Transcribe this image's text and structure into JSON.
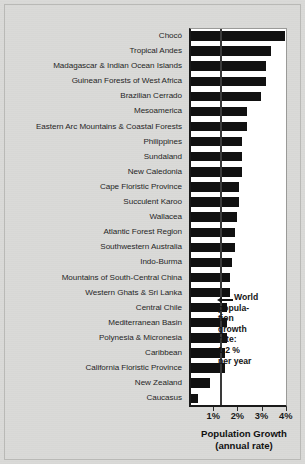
{
  "chart_data": {
    "type": "bar",
    "orientation": "horizontal",
    "title": "",
    "xlabel": "Population Growth",
    "xlabel_sub": "(annual rate)",
    "ylabel": "",
    "xlim": [
      0,
      4.05
    ],
    "grid": false,
    "tick_values": [
      1,
      2,
      3,
      4
    ],
    "tick_labels": [
      "1%",
      "2%",
      "3%",
      "4%"
    ],
    "reference_line": {
      "value": 1.2,
      "label_lines": [
        "World",
        "popula-",
        "tion",
        "growth",
        "rate:",
        "1.2 %",
        "per year"
      ],
      "arrow": "left-arrow-icon"
    },
    "categories": [
      "Chocó",
      "Tropical Andes",
      "Madagascar & Indian Ocean Islands",
      "Guinean Forests of West Africa",
      "Brazilian Cerrado",
      "Mesoamerica",
      "Eastern Arc Mountains & Coastal Forests",
      "Philippines",
      "Sundaland",
      "New Caledonia",
      "Cape Floristic Province",
      "Succulent Karoo",
      "Wallacea",
      "Atlantic Forest Region",
      "Southwestern Australia",
      "Indo-Burma",
      "Mountains of South-Central China",
      "Western Ghats & Sri Lanka",
      "Central Chile",
      "Mediterranean Basin",
      "Polynesia & Micronesia",
      "Caribbean",
      "California Floristic Province",
      "New Zealand",
      "Caucasus"
    ],
    "values": [
      3.9,
      3.3,
      3.1,
      3.1,
      2.9,
      2.3,
      2.3,
      2.1,
      2.1,
      2.1,
      2.0,
      2.0,
      1.9,
      1.8,
      1.8,
      1.7,
      1.6,
      1.6,
      1.5,
      1.5,
      1.5,
      1.4,
      1.4,
      0.8,
      0.3
    ],
    "units": "percent per year",
    "bar_color": "#111111",
    "plot_background": "#ffffff",
    "page_background": "#d9d9d7"
  }
}
